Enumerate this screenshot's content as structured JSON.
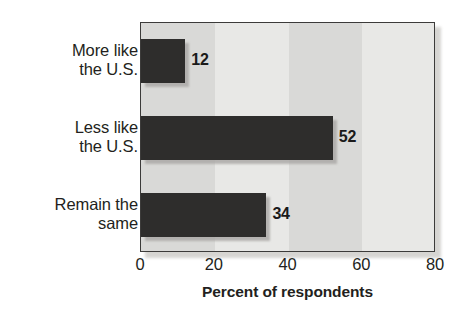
{
  "chart_data": {
    "type": "bar",
    "orientation": "horizontal",
    "title": "",
    "subtitle": "",
    "categories": [
      "More like\nthe U.S.",
      "Less like\nthe U.S.",
      "Remain the\nsame"
    ],
    "category_lines": [
      [
        "More like",
        "the U.S."
      ],
      [
        "Less like",
        "the U.S."
      ],
      [
        "Remain the",
        "same"
      ]
    ],
    "values": [
      12,
      52,
      34
    ],
    "value_labels": [
      "12",
      "52",
      "34"
    ],
    "xlabel": "Percent of respondents",
    "ylabel": "",
    "xlim": [
      0,
      80
    ],
    "xticks": [
      0,
      20,
      40,
      60,
      80
    ],
    "xtick_labels": [
      "0",
      "20",
      "40",
      "60",
      "80"
    ],
    "grid": false,
    "legend": null,
    "bar_color": "#2e2d2c",
    "plot_background_bands": [
      "#d9d9d7",
      "#e8e8e6",
      "#d9d9d7",
      "#e8e8e6"
    ],
    "frame_color": "#3c3b3a"
  },
  "axis": {
    "x_title": "Percent of respondents",
    "tick_labels": [
      "0",
      "20",
      "40",
      "60",
      "80"
    ]
  },
  "bars": [
    {
      "label_line1": "More like",
      "label_line2": "the U.S.",
      "value_label": "12",
      "value": 12
    },
    {
      "label_line1": "Less like",
      "label_line2": "the U.S.",
      "value_label": "52",
      "value": 52
    },
    {
      "label_line1": "Remain the",
      "label_line2": "same",
      "value_label": "34",
      "value": 34
    }
  ]
}
